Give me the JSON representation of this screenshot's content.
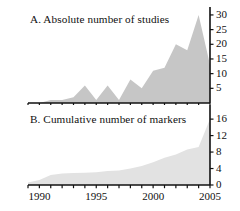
{
  "figure": {
    "background": "#ffffff",
    "axis_color": "#111111",
    "panelA_fill": "#c6c6c6",
    "panelB_fill": "#e2e2e2"
  },
  "panels": {
    "a": {
      "title": "A. Absolute number of studies",
      "ytick_labels": [
        "30",
        "25",
        "20",
        "15",
        "10",
        "5"
      ]
    },
    "b": {
      "title": "B. Cumulative number of markers",
      "ytick_labels": [
        "16",
        "12",
        "8",
        "4",
        "0"
      ]
    }
  },
  "xaxis": {
    "tick_labels": [
      "1990",
      "1995",
      "2000",
      "2005"
    ]
  },
  "chart_data": [
    {
      "type": "area",
      "panel": "A",
      "title": "A. Absolute number of studies",
      "xlabel": "",
      "ylabel": "Absolute number of studies",
      "xlim": [
        1989,
        2005
      ],
      "ylim": [
        0,
        31
      ],
      "yticks": [
        5,
        10,
        15,
        20,
        25,
        30
      ],
      "xticks": [
        1990,
        1995,
        2000,
        2005
      ],
      "minor_xticks": [
        1989,
        1990,
        1991,
        1992,
        1993,
        1994,
        1995,
        1996,
        1997,
        1998,
        1999,
        2000,
        2001,
        2002,
        2003,
        2004,
        2005
      ],
      "grid": false,
      "legend": null,
      "x": [
        1989,
        1990,
        1991,
        1992,
        1993,
        1994,
        1995,
        1996,
        1997,
        1998,
        1999,
        2000,
        2001,
        2002,
        2003,
        2004,
        2005
      ],
      "values": [
        0,
        0,
        1,
        1,
        2,
        6,
        1,
        6,
        1,
        8,
        5,
        11,
        12,
        20,
        18,
        30,
        13
      ],
      "fill_color": "#c6c6c6"
    },
    {
      "type": "area",
      "panel": "B",
      "title": "B. Cumulative number of markers",
      "xlabel": "",
      "ylabel": "Cumulative number of markers",
      "xlim": [
        1989,
        2005
      ],
      "ylim": [
        0,
        17
      ],
      "yticks": [
        0,
        4,
        8,
        12,
        16
      ],
      "xticks": [
        1990,
        1995,
        2000,
        2005
      ],
      "minor_xticks": [
        1989,
        1990,
        1991,
        1992,
        1993,
        1994,
        1995,
        1996,
        1997,
        1998,
        1999,
        2000,
        2001,
        2002,
        2003,
        2004,
        2005
      ],
      "grid": false,
      "legend": null,
      "x": [
        1989,
        1990,
        1991,
        1992,
        1993,
        1994,
        1995,
        1996,
        1997,
        1998,
        1999,
        2000,
        2001,
        2002,
        2003,
        2004,
        2005
      ],
      "values": [
        0.6,
        1.2,
        2.4,
        2.8,
        2.9,
        3.0,
        3.1,
        3.4,
        3.5,
        4.0,
        4.6,
        5.5,
        6.6,
        7.4,
        8.6,
        9.2,
        16.0
      ],
      "fill_color": "#e2e2e2"
    }
  ]
}
